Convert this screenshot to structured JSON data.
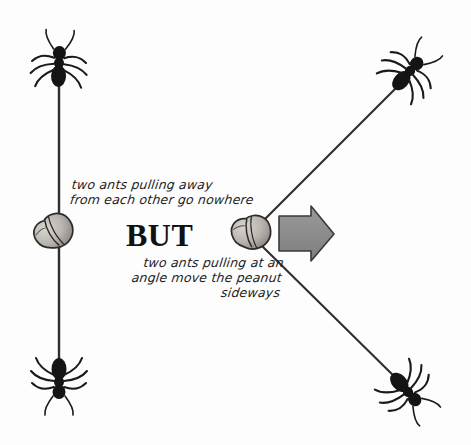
{
  "figure": {
    "background_color": "#fdfdfd",
    "ink_color": "#1a1a1a",
    "arrow_fill_color": "#8a8a8a",
    "peanut_fill_color": "#b9b4ae"
  },
  "captions": {
    "left_line_1": "two ants pulling away",
    "left_line_2": "from each other go nowhere",
    "emphasis": "BUT",
    "right_line_1": "two ants pulling at an",
    "right_line_2": "angle move the peanut",
    "right_line_3": "sideways"
  },
  "objects": {
    "ant_top_left": "ant",
    "ant_bottom_left": "ant",
    "ant_top_right": "ant",
    "ant_bottom_right": "ant",
    "peanut_left": "peanut",
    "peanut_right": "peanut",
    "rope_vertical": "rope",
    "rope_upper_diagonal": "rope",
    "rope_lower_diagonal": "rope",
    "motion_arrow": "arrow pointing right"
  }
}
